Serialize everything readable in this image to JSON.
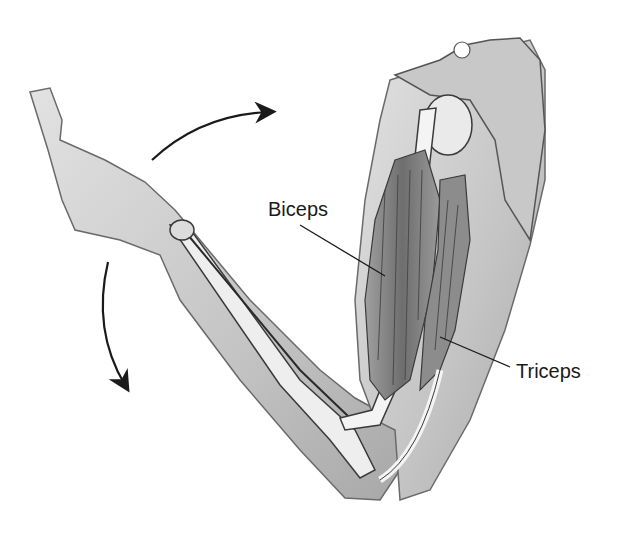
{
  "diagram": {
    "labels": {
      "biceps": "Biceps",
      "triceps": "Triceps"
    },
    "arrows": [
      {
        "name": "upper-motion-arrow",
        "direction": "clockwise"
      },
      {
        "name": "lower-motion-arrow",
        "direction": "counterclockwise"
      }
    ],
    "colors": {
      "background": "#ffffff",
      "skin": "#cfcfcf",
      "skin_dark": "#9a9a9a",
      "bone": "#f2f2f2",
      "muscle": "#7d7d7d",
      "outline": "#3a3a3a",
      "text": "#1a1a1a"
    }
  }
}
